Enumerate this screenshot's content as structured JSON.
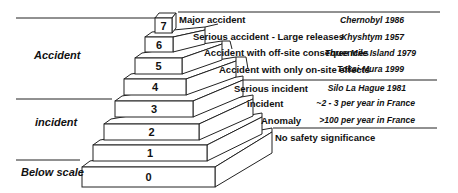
{
  "diagram": {
    "type": "ines-scale-pyramid",
    "categories": [
      {
        "label": "Accident",
        "levels": [
          4,
          5,
          6,
          7
        ]
      },
      {
        "label": "incident",
        "levels": [
          1,
          2,
          3
        ]
      },
      {
        "label": "Below scale",
        "levels": [
          0
        ]
      }
    ],
    "levels": [
      {
        "level": "7",
        "description": "Major accident",
        "example": "Chernobyl 1986"
      },
      {
        "level": "6",
        "description": "Serious accident -  Large releases",
        "example": "Khyshtym 1957"
      },
      {
        "level": "5",
        "description": "Accident with off-site consequences",
        "example": "Three Mile Island 1979"
      },
      {
        "level": "4",
        "description": "Accident with only on-site effects",
        "example": "Tokai-Mura 1999"
      },
      {
        "level": "3",
        "description": "Serious incident",
        "example": "Silo La Hague 1981"
      },
      {
        "level": "2",
        "description": "incident",
        "example": "~2 - 3 per year in France"
      },
      {
        "level": "1",
        "description": "Anomaly",
        "example": ">100 per year in France"
      },
      {
        "level": "0",
        "description": "No safety significance",
        "example": ""
      }
    ],
    "colors": {
      "line": "#222222",
      "fill": "#ffffff",
      "text": "#111111"
    }
  }
}
